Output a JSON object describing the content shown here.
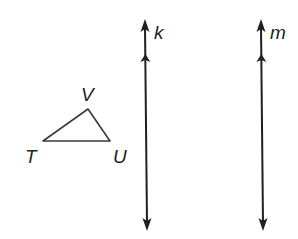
{
  "diagram": {
    "type": "geometry",
    "colors": {
      "stroke": "#231f20",
      "triangle_stroke": "#3a3a3a",
      "background": "#ffffff"
    },
    "triangle": {
      "vertices": [
        {
          "label": "T",
          "x": 43,
          "y": 141,
          "label_x": 25,
          "label_y": 163
        },
        {
          "label": "V",
          "x": 88,
          "y": 109,
          "label_x": 81,
          "label_y": 101
        },
        {
          "label": "U",
          "x": 110,
          "y": 141,
          "label_x": 113,
          "label_y": 163
        }
      ]
    },
    "lines": [
      {
        "label": "k",
        "x1": 145,
        "y1": 19,
        "x2": 147,
        "y2": 231,
        "label_x": 154,
        "label_y": 39,
        "parallel_marker_y": 57
      },
      {
        "label": "m",
        "x1": 261,
        "y1": 19,
        "x2": 263,
        "y2": 231,
        "label_x": 270,
        "label_y": 39,
        "parallel_marker_y": 57
      }
    ],
    "relationships": [
      "k ∥ m"
    ]
  }
}
